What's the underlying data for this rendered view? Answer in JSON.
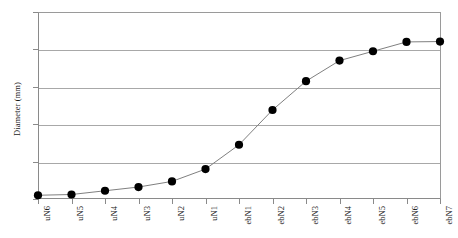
{
  "chart_data": {
    "type": "line",
    "title": "",
    "xlabel": "",
    "ylabel": "Diameter (mm)",
    "ylim": [
      0,
      50
    ],
    "yticks": [
      0,
      10,
      20,
      30,
      40,
      50
    ],
    "grid": true,
    "legend": "none",
    "marker": "filled-circle",
    "marker_color": "#000000",
    "line_color": "#808080",
    "grid_color": "#a8a8a8",
    "axis_color": "#8a8a8a",
    "categories": [
      "uN6",
      "uN5",
      "uN4",
      "uN3",
      "uN2",
      "uN1",
      "ebN1",
      "ebN2",
      "ebN3",
      "ebN4",
      "ebN5",
      "ebN6",
      "ebN7"
    ],
    "values": [
      1.0,
      1.2,
      2.2,
      3.2,
      4.7,
      8.0,
      14.5,
      23.8,
      31.5,
      37.0,
      39.5,
      42.0,
      42.1
    ],
    "series": [
      {
        "name": "Diameter",
        "values": [
          1.0,
          1.2,
          2.2,
          3.2,
          4.7,
          8.0,
          14.5,
          23.8,
          31.5,
          37.0,
          39.5,
          42.0,
          42.1
        ]
      }
    ],
    "points": [
      {
        "category": "uN6",
        "value": 1.0
      },
      {
        "category": "uN5",
        "value": 1.2
      },
      {
        "category": "uN4",
        "value": 2.2
      },
      {
        "category": "uN3",
        "value": 3.2
      },
      {
        "category": "uN2",
        "value": 4.7
      },
      {
        "category": "uN1",
        "value": 8.0
      },
      {
        "category": "ebN1",
        "value": 14.5
      },
      {
        "category": "ebN2",
        "value": 23.8
      },
      {
        "category": "ebN3",
        "value": 31.5
      },
      {
        "category": "ebN4",
        "value": 37.0
      },
      {
        "category": "ebN5",
        "value": 39.5
      },
      {
        "category": "ebN6",
        "value": 42.0
      },
      {
        "category": "ebN7",
        "value": 42.1
      }
    ]
  }
}
